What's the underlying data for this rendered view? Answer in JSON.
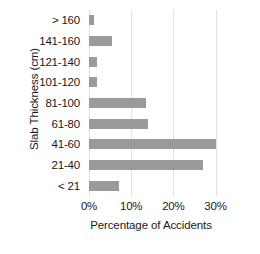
{
  "chart_data": {
    "type": "bar",
    "orientation": "horizontal",
    "title": "",
    "xlabel": "Percentage of Accidents",
    "ylabel": "Slab Thickness (cm)",
    "categories": [
      "> 160",
      "141-160",
      "121-140",
      "101-120",
      "81-100",
      "61-80",
      "41-60",
      "21-40",
      "< 21"
    ],
    "values": [
      1.3,
      5.5,
      2.0,
      2.0,
      13.5,
      14.0,
      30.0,
      27.0,
      7.0
    ],
    "xlim": [
      0,
      32
    ],
    "xticks": [
      0,
      10,
      20,
      30
    ],
    "xtick_labels": [
      "0%",
      "10%",
      "20%",
      "30%"
    ],
    "grid": "vertical",
    "legend": "none",
    "bar_color": "#9a9a9a",
    "grid_color": "#e2e2e2",
    "background_color": "#ffffff"
  }
}
